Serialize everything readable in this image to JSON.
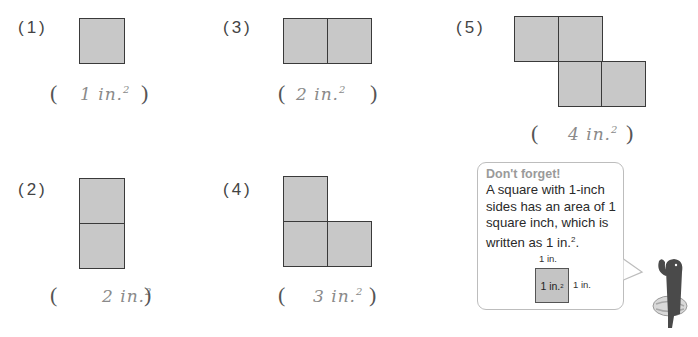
{
  "problems": [
    {
      "number": "(1)",
      "answer": "1 in.",
      "answer_sup": "2"
    },
    {
      "number": "(2)",
      "answer": "2 in.",
      "answer_sup": "2"
    },
    {
      "number": "(3)",
      "answer": "2 in.",
      "answer_sup": "2"
    },
    {
      "number": "(4)",
      "answer": "3 in.",
      "answer_sup": "2"
    },
    {
      "number": "(5)",
      "answer": "4 in.",
      "answer_sup": "2"
    }
  ],
  "paren_open": "(",
  "paren_close": ")",
  "note": {
    "title": "Don't forget!",
    "body_main": "A square with 1-inch sides has an area of 1 square inch, which is written as 1 in.",
    "body_sup": "2",
    "body_end": ".",
    "diagram": {
      "top_label": "1 in.",
      "side_label": "1 in.",
      "square_label": "1 in.",
      "square_sup": "2"
    }
  },
  "colors": {
    "square_fill": "#c8c8c8",
    "square_border": "#3a3a3a",
    "note_border": "#bdbdbd",
    "note_title": "#9a9a9a",
    "handwriting": "#8a8a8a"
  }
}
